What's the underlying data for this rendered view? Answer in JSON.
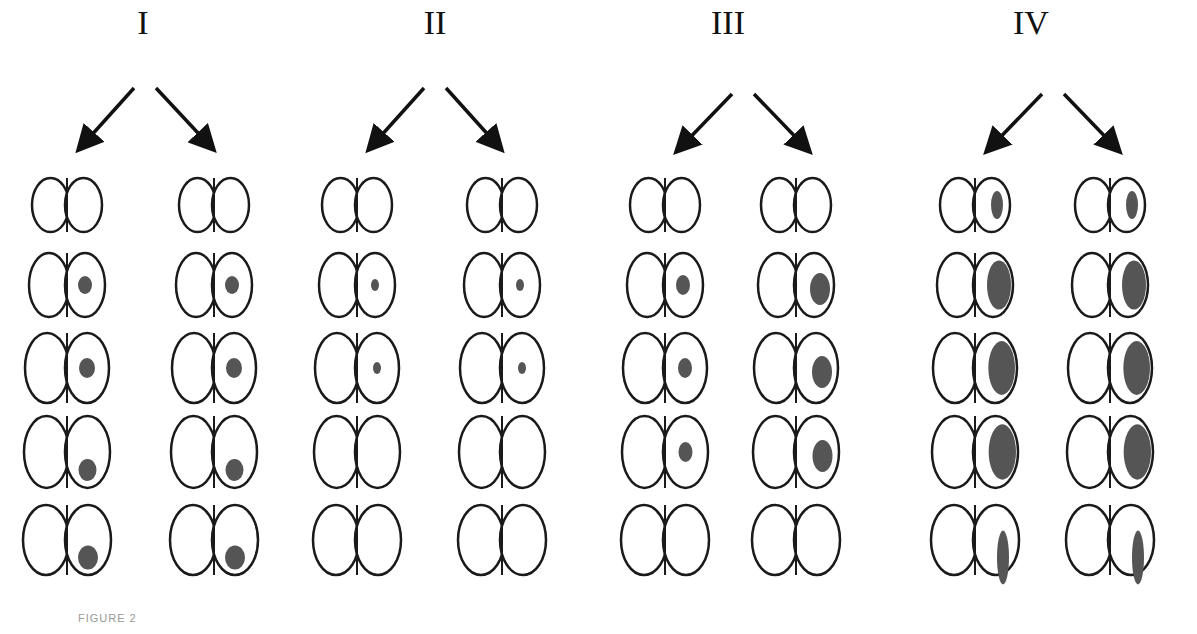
{
  "groups": [
    {
      "label": "I",
      "x": 143
    },
    {
      "label": "II",
      "x": 435
    },
    {
      "label": "III",
      "x": 728
    },
    {
      "label": "IV",
      "x": 1031
    }
  ],
  "figure_caption": "FIGURE 2",
  "colors": {
    "outline": "#1a1a1a",
    "lesion": "#555555",
    "background": "#ffffff"
  },
  "rows": 5,
  "columns_per_group": 2
}
